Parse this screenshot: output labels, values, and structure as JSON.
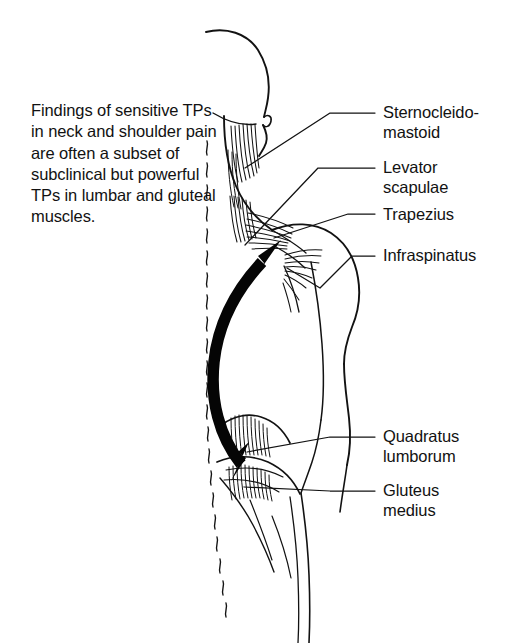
{
  "figure": {
    "kind": "anatomical-line-drawing",
    "ink_color": "#121212",
    "background_color": "#ffffff"
  },
  "caption": {
    "text": "Findings of sensitive TPs in neck and shoulder pain are often a subset of subclinical but powerful TPs in lumbar and gluteal muscles."
  },
  "labels": [
    {
      "id": "sternocleidomastoid",
      "text": "Sternocleido-\nmastoid"
    },
    {
      "id": "levator_scapulae",
      "text": "Levator\nscapulae"
    },
    {
      "id": "trapezius",
      "text": "Trapezius"
    },
    {
      "id": "infraspinatus",
      "text": "Infraspinatus"
    },
    {
      "id": "quadratus_lumborum",
      "text": "Quadratus\nlumborum"
    },
    {
      "id": "gluteus_medius",
      "text": "Gluteus\nmedius"
    }
  ],
  "annotations": {
    "midline": "wavy dashed vertical spinal midline",
    "arrow": "thick double-headed curved arrow linking gluteal region to shoulder region"
  }
}
